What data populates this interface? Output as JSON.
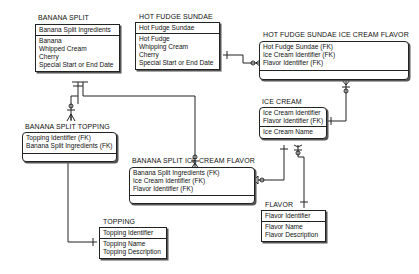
{
  "entities": {
    "banana_split": {
      "title": "BANANA SPLIT",
      "keys": [
        "Banana Split Ingredients"
      ],
      "attrs": [
        "Banana",
        "Whipped Cream",
        "Cherry",
        "Special Start or End Date"
      ]
    },
    "hot_fudge_sundae": {
      "title": "HOT FUDGE SUNDAE",
      "keys": [
        "Hot Fudge Sundae"
      ],
      "attrs": [
        "Hot Fudge",
        "Whipping Cream",
        "Cherry",
        "Special Start or End Date"
      ]
    },
    "hfs_ice_cream_flavor": {
      "title": "HOT FUDGE SUNDAE ICE CREAM FLAVOR",
      "keys": [
        "Hot Fudge Sundae (FK)",
        "Ice Cream Identifier (FK)",
        "Flavor Identifier (FK)"
      ],
      "attrs": []
    },
    "banana_split_topping": {
      "title": "BANANA SPLIT TOPPING",
      "keys": [
        "Topping Identifier (FK)",
        "Banana Split Ingredients (FK)"
      ],
      "attrs": []
    },
    "ice_cream": {
      "title": "ICE CREAM",
      "keys": [
        "Ice Cream Identifier",
        "Flavor Identifier (FK)"
      ],
      "attrs": [
        "Ice Cream Name"
      ]
    },
    "bs_ice_cream_flavor": {
      "title": "BANANA SPLIT ICE CREAM FLAVOR",
      "keys": [
        "Banana Split Ingredients (FK)",
        "Ice Cream Identifier (FK)",
        "Flavor Identifier (FK)"
      ],
      "attrs": []
    },
    "flavor": {
      "title": "FLAVOR",
      "keys": [
        "Flavor Identifier"
      ],
      "attrs": [
        "Flavor Name",
        "Flavor Description"
      ]
    },
    "topping": {
      "title": "TOPPING",
      "keys": [
        "Topping Identifier"
      ],
      "attrs": [
        "Topping Name",
        "Topping Description"
      ]
    }
  },
  "relationships": [
    {
      "from": "BANANA SPLIT",
      "to": "BANANA SPLIT TOPPING",
      "cardinality": "one-to-zero-or-more"
    },
    {
      "from": "BANANA SPLIT",
      "to": "BANANA SPLIT ICE CREAM FLAVOR",
      "cardinality": "one-to-zero-or-more"
    },
    {
      "from": "HOT FUDGE SUNDAE",
      "to": "HOT FUDGE SUNDAE ICE CREAM FLAVOR",
      "cardinality": "one-to-zero-or-more"
    },
    {
      "from": "ICE CREAM",
      "to": "HOT FUDGE SUNDAE ICE CREAM FLAVOR",
      "cardinality": "one-to-zero-or-more"
    },
    {
      "from": "ICE CREAM",
      "to": "BANANA SPLIT ICE CREAM FLAVOR",
      "cardinality": "one-to-zero-or-more"
    },
    {
      "from": "FLAVOR",
      "to": "ICE CREAM",
      "cardinality": "one-to-zero-or-more"
    },
    {
      "from": "TOPPING",
      "to": "BANANA SPLIT TOPPING",
      "cardinality": "one-to-zero-or-more"
    }
  ]
}
